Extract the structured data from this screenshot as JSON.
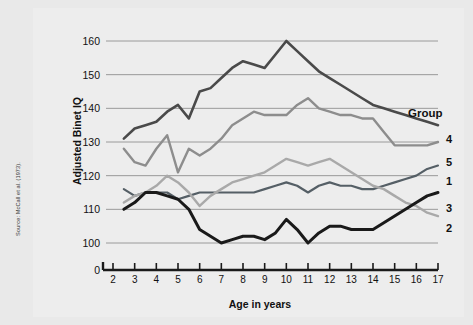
{
  "source_note": "Source: McCall et al. (1973).",
  "legend": {
    "header": "Group",
    "entries": [
      {
        "label": "4",
        "y": 143
      },
      {
        "label": "5",
        "y": 166
      },
      {
        "label": "1",
        "y": 185
      },
      {
        "label": "3",
        "y": 212
      },
      {
        "label": "2",
        "y": 232
      }
    ]
  },
  "chart_data": {
    "type": "line",
    "title": "",
    "xlabel": "Age in years",
    "ylabel": "Adjusted Binet IQ",
    "xlim": [
      2,
      17
    ],
    "ylim": [
      95,
      163
    ],
    "grid": true,
    "legend_position": "right",
    "yticks": [
      100,
      110,
      120,
      130,
      140,
      150,
      160
    ],
    "y_axis_break_label": "0",
    "xticks": [
      2,
      3,
      4,
      5,
      6,
      7,
      8,
      9,
      10,
      11,
      12,
      13,
      14,
      15,
      16,
      17
    ],
    "series": [
      {
        "name": "4",
        "color": "#4a4a4a",
        "width": 2.6,
        "x": [
          2.5,
          3,
          3.5,
          4,
          4.5,
          5,
          5.5,
          6,
          6.5,
          7,
          7.5,
          8,
          8.5,
          9,
          9.5,
          10,
          10.5,
          11,
          11.5,
          12,
          12.5,
          13,
          13.5,
          14,
          14.5,
          15,
          15.5,
          16,
          16.5,
          17
        ],
        "y": [
          131,
          134,
          135,
          136,
          139,
          141,
          137,
          145,
          146,
          149,
          152,
          154,
          153,
          152,
          156,
          160,
          157,
          154,
          151,
          149,
          147,
          145,
          143,
          141,
          140,
          139,
          138,
          137,
          136,
          135
        ]
      },
      {
        "name": "5",
        "color": "#8d8d8d",
        "width": 2.4,
        "x": [
          2.5,
          3,
          3.5,
          4,
          4.5,
          5,
          5.5,
          6,
          6.5,
          7,
          7.5,
          8,
          8.5,
          9,
          9.5,
          10,
          10.5,
          11,
          11.5,
          12,
          12.5,
          13,
          13.5,
          14,
          14.5,
          15,
          15.5,
          16,
          16.5,
          17
        ],
        "y": [
          128,
          124,
          123,
          128,
          132,
          121,
          128,
          126,
          128,
          131,
          135,
          137,
          139,
          138,
          138,
          138,
          141,
          143,
          140,
          139,
          138,
          138,
          137,
          137,
          133,
          129,
          129,
          129,
          129,
          130
        ]
      },
      {
        "name": "1",
        "color": "#555f66",
        "width": 2.2,
        "x": [
          2.5,
          3,
          3.5,
          4,
          4.5,
          5,
          5.5,
          6,
          6.5,
          7,
          7.5,
          8,
          8.5,
          9,
          9.5,
          10,
          10.5,
          11,
          11.5,
          12,
          12.5,
          13,
          13.5,
          14,
          14.5,
          15,
          15.5,
          16,
          16.5,
          17
        ],
        "y": [
          116,
          114,
          115,
          115,
          115,
          113,
          114,
          115,
          115,
          115,
          115,
          115,
          115,
          116,
          117,
          118,
          117,
          115,
          117,
          118,
          117,
          117,
          116,
          116,
          117,
          118,
          119,
          120,
          122,
          123
        ]
      },
      {
        "name": "2",
        "color": "#a9a9a9",
        "width": 2.4,
        "x": [
          2.5,
          3,
          3.5,
          4,
          4.5,
          5,
          5.5,
          6,
          6.5,
          7,
          7.5,
          8,
          8.5,
          9,
          9.5,
          10,
          10.5,
          11,
          11.5,
          12,
          12.5,
          13,
          13.5,
          14,
          14.5,
          15,
          15.5,
          16,
          16.5,
          17
        ],
        "y": [
          112,
          114,
          115,
          117,
          120,
          118,
          115,
          111,
          114,
          116,
          118,
          119,
          120,
          121,
          123,
          125,
          124,
          123,
          124,
          125,
          123,
          121,
          119,
          117,
          116,
          114,
          112,
          111,
          109,
          108
        ]
      },
      {
        "name": "3",
        "color": "#1a1a1a",
        "width": 3.0,
        "x": [
          2.5,
          3,
          3.5,
          4,
          4.5,
          5,
          5.5,
          6,
          6.5,
          7,
          7.5,
          8,
          8.5,
          9,
          9.5,
          10,
          10.5,
          11,
          11.5,
          12,
          12.5,
          13,
          13.5,
          14,
          14.5,
          15,
          15.5,
          16,
          16.5,
          17
        ],
        "y": [
          110,
          112,
          115,
          115,
          114,
          113,
          110,
          104,
          102,
          100,
          101,
          102,
          102,
          101,
          103,
          107,
          104,
          100,
          103,
          105,
          105,
          104,
          104,
          104,
          106,
          108,
          110,
          112,
          114,
          115
        ]
      }
    ]
  }
}
